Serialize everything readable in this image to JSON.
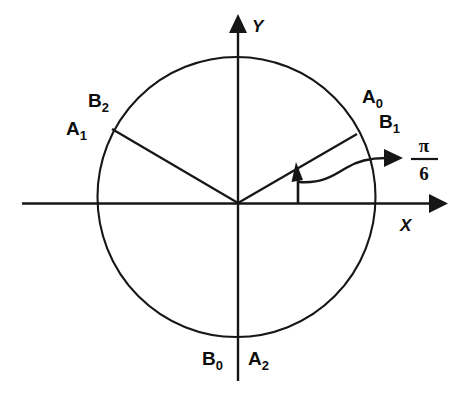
{
  "figure": {
    "background_color": "#ffffff",
    "ink_color": "#161616"
  },
  "axes": {
    "x_label": "X",
    "y_label": "Y",
    "origin": {
      "x": 238,
      "y": 203
    }
  },
  "circle": {
    "center_x": 236.5,
    "center_y": 197,
    "radius": 139
  },
  "radii": [
    {
      "name": "radius-right",
      "angle_deg": 30,
      "end_x": 356,
      "end_y": 135
    },
    {
      "name": "radius-left",
      "angle_deg": 150,
      "end_x": 113,
      "end_y": 130
    }
  ],
  "angle_annotation": {
    "numerator": "π",
    "denominator": "6",
    "label_x": 425,
    "label_y": 158
  },
  "point_labels": [
    {
      "name": "label-a0",
      "base": "A",
      "sub": "0",
      "x": 362,
      "y": 103
    },
    {
      "name": "label-b1",
      "base": "B",
      "sub": "1",
      "x": 379,
      "y": 128
    },
    {
      "name": "label-b2",
      "base": "B",
      "sub": "2",
      "x": 88,
      "y": 107
    },
    {
      "name": "label-a1",
      "base": "A",
      "sub": "1",
      "x": 66,
      "y": 135
    },
    {
      "name": "label-b0",
      "base": "B",
      "sub": "0",
      "x": 202,
      "y": 365
    },
    {
      "name": "label-a2",
      "base": "A",
      "sub": "2",
      "x": 248,
      "y": 365
    }
  ]
}
